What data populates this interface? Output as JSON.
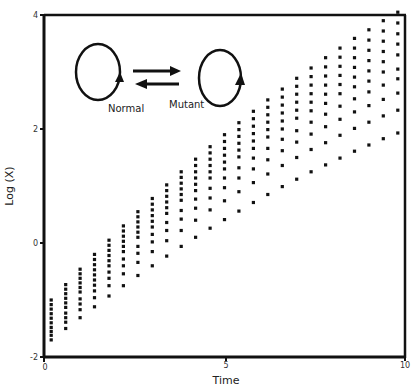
{
  "chart_data": {
    "type": "scatter",
    "title": "",
    "xlabel": "Time",
    "ylabel": "Log (X)",
    "xlim": [
      0,
      10
    ],
    "ylim": [
      -2,
      4
    ],
    "x_ticks": [
      0,
      5,
      10
    ],
    "y_ticks": [
      -2,
      0,
      2,
      4
    ],
    "grid": false,
    "legend": null,
    "marker": "square",
    "marker_color": "#111111",
    "x": [
      0.2,
      0.6,
      1.0,
      1.4,
      1.8,
      2.2,
      2.6,
      3.0,
      3.4,
      3.8,
      4.2,
      4.6,
      5.0,
      5.4,
      5.8,
      6.2,
      6.6,
      7.0,
      7.4,
      7.8,
      8.2,
      8.6,
      9.0,
      9.4,
      9.8
    ],
    "series": [
      {
        "name": "series-1",
        "values": [
          -1.0,
          -0.73,
          -0.46,
          -0.2,
          0.05,
          0.3,
          0.55,
          0.78,
          1.02,
          1.25,
          1.47,
          1.69,
          1.9,
          2.11,
          2.31,
          2.51,
          2.7,
          2.89,
          3.07,
          3.25,
          3.42,
          3.59,
          3.74,
          3.9,
          4.05
        ]
      },
      {
        "name": "series-2",
        "values": [
          -1.08,
          -0.81,
          -0.54,
          -0.29,
          -0.04,
          0.21,
          0.46,
          0.68,
          0.92,
          1.15,
          1.36,
          1.58,
          1.78,
          1.99,
          2.18,
          2.38,
          2.56,
          2.75,
          2.92,
          3.09,
          3.26,
          3.42,
          3.56,
          3.72,
          3.86
        ]
      },
      {
        "name": "series-3",
        "values": [
          -1.16,
          -0.89,
          -0.62,
          -0.38,
          -0.13,
          0.12,
          0.37,
          0.58,
          0.82,
          1.05,
          1.25,
          1.47,
          1.66,
          1.87,
          2.05,
          2.25,
          2.42,
          2.61,
          2.77,
          2.93,
          3.1,
          3.25,
          3.38,
          3.54,
          3.67
        ]
      },
      {
        "name": "series-4",
        "values": [
          -1.24,
          -0.97,
          -0.7,
          -0.47,
          -0.22,
          0.03,
          0.28,
          0.48,
          0.72,
          0.95,
          1.14,
          1.36,
          1.54,
          1.75,
          1.92,
          2.12,
          2.28,
          2.47,
          2.62,
          2.77,
          2.94,
          3.08,
          3.2,
          3.36,
          3.49
        ]
      },
      {
        "name": "series-5",
        "values": [
          -1.32,
          -1.05,
          -0.78,
          -0.56,
          -0.31,
          -0.06,
          0.19,
          0.38,
          0.62,
          0.85,
          1.03,
          1.25,
          1.42,
          1.63,
          1.79,
          1.99,
          2.14,
          2.33,
          2.47,
          2.61,
          2.78,
          2.91,
          3.02,
          3.18,
          3.3
        ]
      },
      {
        "name": "series-6",
        "values": [
          -1.4,
          -1.13,
          -0.86,
          -0.65,
          -0.4,
          -0.15,
          0.1,
          0.28,
          0.52,
          0.75,
          0.92,
          1.14,
          1.3,
          1.51,
          1.66,
          1.86,
          2.0,
          2.19,
          2.32,
          2.45,
          2.62,
          2.74,
          2.84,
          3.0,
          3.05
        ]
      },
      {
        "name": "series-7",
        "values": [
          -1.48,
          -1.23,
          -0.98,
          -0.74,
          -0.51,
          -0.28,
          -0.06,
          0.15,
          0.36,
          0.57,
          0.77,
          0.96,
          1.14,
          1.32,
          1.49,
          1.66,
          1.82,
          1.97,
          2.12,
          2.26,
          2.4,
          2.53,
          2.65,
          2.77,
          2.88
        ]
      },
      {
        "name": "series-8",
        "values": [
          -1.55,
          -1.31,
          -1.07,
          -0.84,
          -0.62,
          -0.4,
          -0.18,
          0.02,
          0.22,
          0.42,
          0.61,
          0.79,
          0.97,
          1.14,
          1.3,
          1.46,
          1.62,
          1.77,
          1.91,
          2.04,
          2.17,
          2.3,
          2.41,
          2.52,
          2.63
        ]
      },
      {
        "name": "series-9",
        "values": [
          -1.62,
          -1.39,
          -1.17,
          -0.96,
          -0.75,
          -0.54,
          -0.34,
          -0.15,
          0.04,
          0.22,
          0.4,
          0.58,
          0.74,
          0.9,
          1.06,
          1.21,
          1.36,
          1.5,
          1.64,
          1.76,
          1.89,
          2.01,
          2.12,
          2.23,
          2.33
        ]
      },
      {
        "name": "series-10",
        "values": [
          -1.7,
          -1.5,
          -1.31,
          -1.12,
          -0.93,
          -0.75,
          -0.57,
          -0.4,
          -0.23,
          -0.06,
          0.1,
          0.26,
          0.41,
          0.56,
          0.71,
          0.85,
          0.99,
          1.12,
          1.25,
          1.37,
          1.49,
          1.61,
          1.72,
          1.83,
          1.93
        ]
      }
    ],
    "annotations": {
      "diagram": {
        "left_label": "Normal",
        "right_label": "Mutant",
        "left_icon": "cycle-loop-icon",
        "right_icon": "cycle-loop-icon",
        "center_icon": "bidirectional-arrows-icon"
      }
    }
  },
  "axes": {
    "x_title": "Time",
    "y_title": "Log (X)",
    "x_tick_labels": [
      "0",
      "5",
      "10"
    ],
    "y_tick_labels": [
      "-2",
      "0",
      "2",
      "4"
    ]
  },
  "diagram": {
    "normal_label": "Normal",
    "mutant_label": "Mutant"
  },
  "colors": {
    "ink": "#111111",
    "background": "#ffffff"
  }
}
